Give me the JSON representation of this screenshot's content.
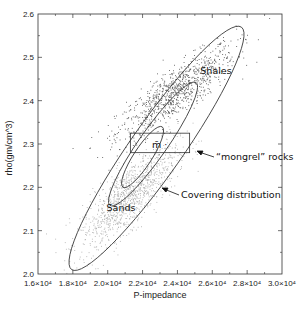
{
  "chart_data": {
    "type": "scatter",
    "title": "",
    "xlabel": "P-impedance",
    "ylabel": "rho(gm/cm^3)",
    "xlim": [
      16000,
      30000
    ],
    "ylim": [
      2.0,
      2.6
    ],
    "grid": false,
    "x_ticks": [
      16000,
      18000,
      20000,
      22000,
      24000,
      26000,
      28000,
      30000
    ],
    "x_tick_labels": [
      "1.6×10⁴",
      "1.8×10⁴",
      "2.0×10⁴",
      "2.2×10⁴",
      "2.4×10⁴",
      "2.6×10⁴",
      "2.8×10⁴",
      "3.0×10⁴"
    ],
    "y_ticks": [
      2.0,
      2.1,
      2.2,
      2.3,
      2.4,
      2.5,
      2.6
    ],
    "y_tick_labels": [
      "2.0",
      "2.1",
      "2.2",
      "2.3",
      "2.4",
      "2.5",
      "2.6"
    ],
    "series": [
      {
        "name": "Shales",
        "color": "#555555",
        "center": [
          23900,
          2.42
        ],
        "spread": [
          1700,
          0.055
        ],
        "correlation": 0.85,
        "count": 900
      },
      {
        "name": "Sands",
        "color": "#b0b0b0",
        "center": [
          21200,
          2.18
        ],
        "spread": [
          1400,
          0.06
        ],
        "correlation": 0.8,
        "count": 1100
      }
    ],
    "ellipses": [
      {
        "name": "Covering distribution",
        "center": [
          22800,
          2.29
        ],
        "semi_major_px": 148,
        "semi_minor_px": 26,
        "angle_deg": -55
      },
      {
        "name": "Shale ellipse",
        "center": [
          22600,
          2.3
        ],
        "semi_major_px": 75,
        "semi_minor_px": 14,
        "angle_deg": -55
      },
      {
        "name": "Inner ellipse",
        "center": [
          22000,
          2.27
        ],
        "semi_major_px": 36,
        "semi_minor_px": 9,
        "angle_deg": -57
      }
    ],
    "rectangle": {
      "name": "mongrel rocks",
      "x_range": [
        21300,
        24700
      ],
      "y_range": [
        2.28,
        2.325
      ]
    },
    "annotations": [
      {
        "text": "Shales",
        "x": 24900,
        "y": 2.495
      },
      {
        "text": "Sands",
        "x": 20300,
        "y": 2.18
      },
      {
        "text": "m̄ ·",
        "x": 22100,
        "y": 2.3
      },
      {
        "text": "“mongrel” rocks",
        "x": 26400,
        "y": 2.285
      },
      {
        "text": "Covering distribution",
        "x": 25400,
        "y": 2.22
      }
    ]
  },
  "labels": {
    "xlabel": "P-impedance",
    "ylabel": "rho(gm/cm^3)",
    "shales": "Shales",
    "sands": "Sands",
    "mbar": "m̄ ·",
    "mongrel": "“mongrel” rocks",
    "covering": "Covering distribution"
  }
}
